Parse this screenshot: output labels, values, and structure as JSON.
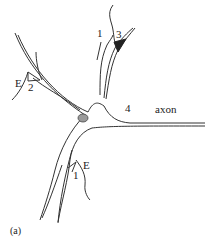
{
  "diagram": {
    "type": "neuron-schematic",
    "panel_label": "(a)",
    "labels": {
      "synapse_1_top": "1",
      "synapse_3_top": "3",
      "synapse_E_left": "E",
      "synapse_2_left": "2",
      "synapse_4_axon": "4",
      "axon": "axon",
      "synapse_E_bottom": "E",
      "synapse_1_bottom": "1"
    },
    "colors": {
      "stroke": "#333333",
      "background": "#ffffff",
      "nucleus_fill": "#9a9a9a"
    }
  }
}
